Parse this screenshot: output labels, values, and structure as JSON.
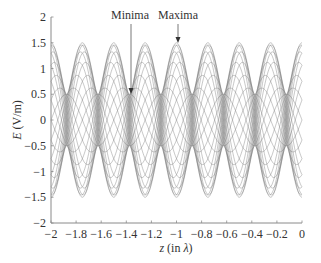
{
  "chart_data": {
    "type": "line",
    "title": "",
    "xlabel": "z (in λ)",
    "xlabel_parts": {
      "var": "z",
      "rest": " (in ",
      "sym": "λ",
      "close": ")"
    },
    "ylabel": "E (V/m)",
    "ylabel_parts": {
      "var": "E",
      "rest": " (V/m)"
    },
    "xlim": [
      -2,
      0
    ],
    "ylim": [
      -2,
      2
    ],
    "xticks": [
      -2,
      -1.8,
      -1.6,
      -1.4,
      -1.2,
      -1,
      -0.8,
      -0.6,
      -0.4,
      -0.2,
      0
    ],
    "xtick_labels": [
      "−2",
      "−1.8",
      "−1.6",
      "−1.4",
      "−1.2",
      "−1",
      "−0.8",
      "−0.6",
      "−0.4",
      "−0.2",
      "0"
    ],
    "yticks": [
      -2,
      -1.5,
      -1,
      -0.5,
      0,
      0.5,
      1,
      1.5,
      2
    ],
    "ytick_labels": [
      "−2",
      "−1.5",
      "−1",
      "−0.5",
      "0",
      "0.5",
      "1",
      "1.5",
      "2"
    ],
    "grid": false,
    "legend": null,
    "model": {
      "incident_amplitude": 1.0,
      "reflected_amplitude": 0.5,
      "envelope_max": 1.5,
      "envelope_min": 0.5,
      "envelope_period": 0.25,
      "maxima_z": [
        -2,
        -1.75,
        -1.5,
        -1.25,
        -1,
        -0.75,
        -0.5,
        -0.25,
        0
      ],
      "minima_z": [
        -1.875,
        -1.625,
        -1.375,
        -1.125,
        -0.875,
        -0.625,
        -0.375,
        -0.125
      ],
      "num_snapshots": 24
    },
    "annotations": [
      {
        "text": "Minima",
        "z": -1.375,
        "value": 0.5
      },
      {
        "text": "Maxima",
        "z": -1.0,
        "value": 1.5
      }
    ],
    "line_color": "#6e6e6e",
    "axis_color": "#8a8a8a"
  }
}
